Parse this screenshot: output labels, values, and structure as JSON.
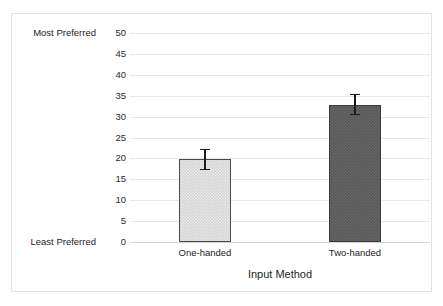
{
  "chart_data": {
    "type": "bar",
    "title": "",
    "subtitle": "",
    "xlabel": "Input Method",
    "ylabel": "",
    "categories": [
      "One-handed",
      "Two-handed"
    ],
    "values": [
      19.8,
      32.8
    ],
    "errors": [
      2.5,
      2.5
    ],
    "error_type": "symmetric",
    "series": [
      {
        "name": "Preference rating",
        "values": [
          19.8,
          32.8
        ],
        "errors": [
          2.5,
          2.5
        ]
      }
    ],
    "ylim": [
      0,
      50
    ],
    "ytick_step": 5,
    "yticks": [
      0,
      5,
      10,
      15,
      20,
      25,
      30,
      35,
      40,
      45,
      50
    ],
    "ytick_labels": [
      "0",
      "5",
      "10",
      "15",
      "20",
      "25",
      "30",
      "35",
      "40",
      "45",
      "50"
    ],
    "grid": "horizontal",
    "legend": "none",
    "annotations": [
      {
        "text": "Most Preferred",
        "at_value": 50,
        "position": "left-of-axis"
      },
      {
        "text": "Least Preferred",
        "at_value": 0,
        "position": "left-of-axis"
      }
    ],
    "bar_styles": [
      {
        "category": "One-handed",
        "fill": "#d4d4d4",
        "border": "#4a4a4a"
      },
      {
        "category": "Two-handed",
        "fill": "#575757",
        "border": "#3b3b3b"
      }
    ],
    "colors": {
      "gridline": "#e8e8e8",
      "baseline": "#d5d5d5",
      "errorbar": "#1c1c1c",
      "figure_border": "#e3e3e3",
      "text": "#1d1d1d",
      "background": "#ffffff"
    }
  }
}
